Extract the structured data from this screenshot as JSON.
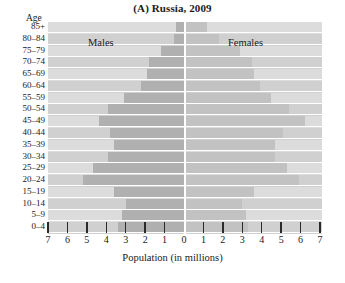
{
  "chart_data": {
    "type": "bar",
    "subtype": "population-pyramid",
    "title": "(A) Russia, 2009",
    "xlabel": "Population (in millions)",
    "ylabel": "Age",
    "grid": false,
    "legend_position": "in-plot",
    "xlim": [
      -7,
      7
    ],
    "xticks": [
      7,
      6,
      5,
      4,
      3,
      2,
      1,
      0,
      1,
      2,
      3,
      4,
      5,
      6,
      7
    ],
    "xtick_labels": [
      "7",
      "6",
      "5",
      "4",
      "3",
      "2",
      "1",
      "0",
      "1",
      "2",
      "3",
      "4",
      "5",
      "6",
      "7"
    ],
    "categories": [
      "85+",
      "80–84",
      "75–79",
      "70–74",
      "65–69",
      "60–64",
      "55–59",
      "50–54",
      "45–49",
      "40–44",
      "35–39",
      "30–34",
      "25–29",
      "20–24",
      "15–19",
      "10–14",
      "5–9",
      "0–4"
    ],
    "series": [
      {
        "name": "Males",
        "side": "left",
        "color": "#b0b0b0",
        "values": [
          0.4,
          0.5,
          1.2,
          1.8,
          1.9,
          2.2,
          3.1,
          3.9,
          4.4,
          3.8,
          3.6,
          3.9,
          4.7,
          5.2,
          3.6,
          3.0,
          3.2,
          3.4
        ]
      },
      {
        "name": "Females",
        "side": "right",
        "color": "#c2c2c2",
        "values": [
          1.1,
          1.7,
          2.8,
          3.4,
          3.5,
          3.8,
          4.4,
          5.3,
          6.1,
          5.0,
          4.6,
          4.6,
          5.2,
          5.8,
          3.5,
          2.9,
          3.1,
          3.2
        ]
      }
    ]
  },
  "labels": {
    "males": "Males",
    "females": "Females"
  }
}
